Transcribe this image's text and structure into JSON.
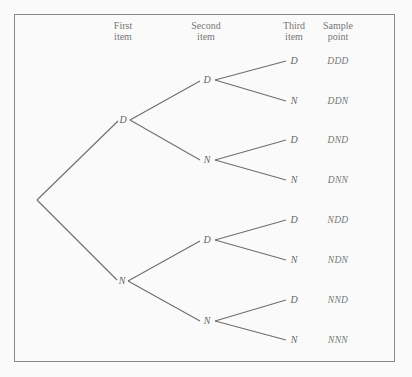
{
  "headers": {
    "first": "First\nitem",
    "second": "Second\nitem",
    "third": "Third\nitem",
    "sample": "Sample\npoint"
  },
  "header_lines": {
    "first": [
      "First",
      "item"
    ],
    "second": [
      "Second",
      "item"
    ],
    "third": [
      "Third",
      "item"
    ],
    "sample": [
      "Sample",
      "point"
    ]
  },
  "tree": {
    "level1": [
      "D",
      "N"
    ],
    "level2": [
      "D",
      "N",
      "D",
      "N"
    ],
    "level3": [
      "D",
      "N",
      "D",
      "N",
      "D",
      "N",
      "D",
      "N"
    ]
  },
  "sample_points": [
    "DDD",
    "DDN",
    "DND",
    "DNN",
    "NDD",
    "NDN",
    "NND",
    "NNN"
  ],
  "colors": {
    "line": "#6e6e6e",
    "border": "#8a8a8a",
    "text": "#666666"
  }
}
